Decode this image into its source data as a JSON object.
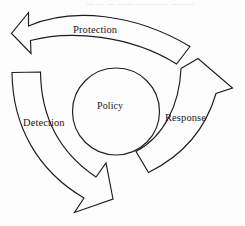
{
  "figure": {
    "type": "cycle-diagram",
    "orientation": "counter-clockwise",
    "background_color": "#fdfdfd",
    "stroke_color": "#1d1d1d",
    "center": {
      "label": "Policy",
      "shape": "circle"
    },
    "arrows": [
      {
        "id": "protection",
        "label": "Protection",
        "position": "top",
        "direction": "points-left"
      },
      {
        "id": "detection",
        "label": "Detection",
        "position": "left",
        "direction": "points-down-left"
      },
      {
        "id": "response",
        "label": "Response",
        "position": "right",
        "direction": "points-up-right"
      }
    ],
    "artifact_text": "—  —   —  ——  ————  ———"
  }
}
